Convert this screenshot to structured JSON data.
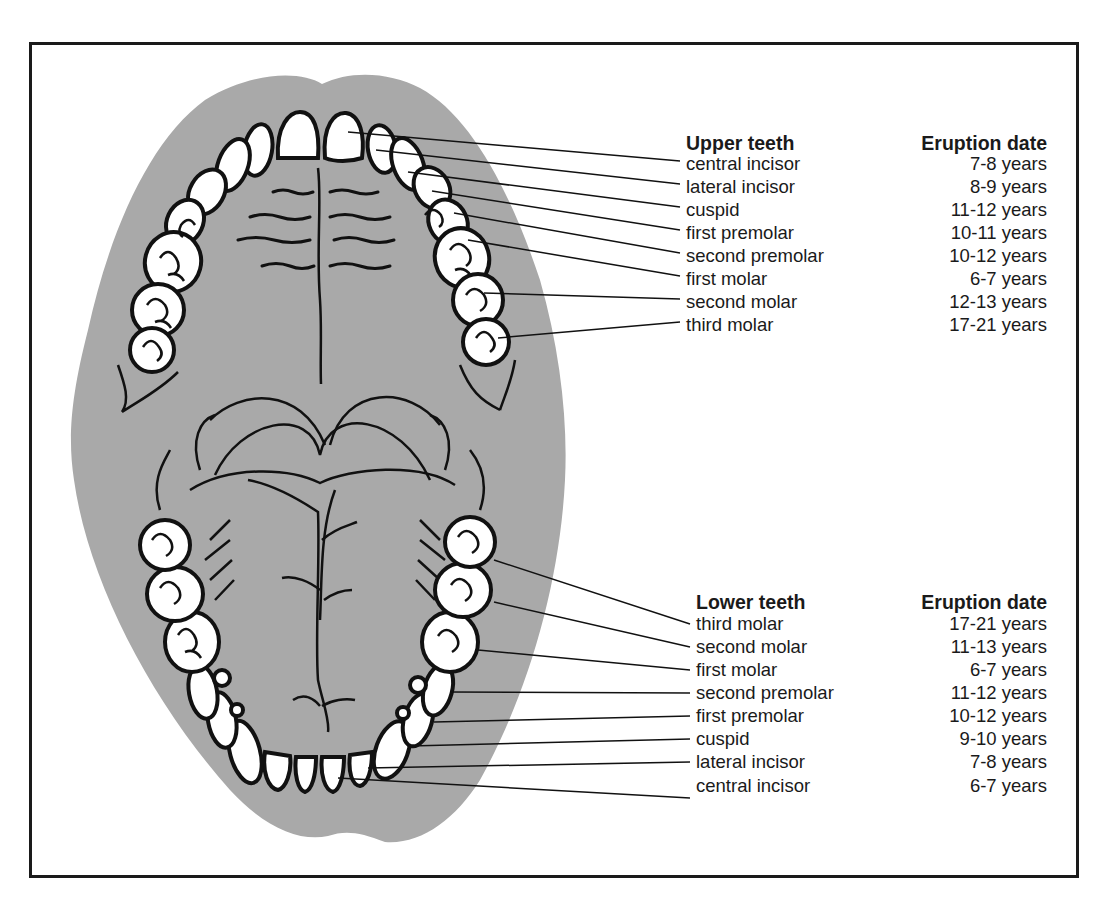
{
  "figure": {
    "colors": {
      "mouth_fill": "#a9a9a9",
      "tooth_fill": "#ffffff",
      "outline": "#111111",
      "frame": "#1a1a1a"
    }
  },
  "upper": {
    "header_name": "Upper teeth",
    "header_date": "Eruption date",
    "rows": [
      {
        "name": "central incisor",
        "date": "7-8 years"
      },
      {
        "name": "lateral incisor",
        "date": "8-9 years"
      },
      {
        "name": "cuspid",
        "date": "11-12 years"
      },
      {
        "name": "first premolar",
        "date": "10-11 years"
      },
      {
        "name": "second premolar",
        "date": "10-12 years"
      },
      {
        "name": "first molar",
        "date": "6-7 years"
      },
      {
        "name": "second molar",
        "date": "12-13 years"
      },
      {
        "name": "third molar",
        "date": "17-21 years"
      }
    ]
  },
  "lower": {
    "header_name": "Lower teeth",
    "header_date": "Eruption date",
    "rows": [
      {
        "name": "third molar",
        "date": "17-21 years"
      },
      {
        "name": "second molar",
        "date": "11-13 years"
      },
      {
        "name": "first molar",
        "date": "6-7 years"
      },
      {
        "name": "second premolar",
        "date": "11-12 years"
      },
      {
        "name": "first premolar",
        "date": "10-12 years"
      },
      {
        "name": "cuspid",
        "date": "9-10 years"
      },
      {
        "name": "lateral incisor",
        "date": "7-8 years"
      },
      {
        "name": "central incisor",
        "date": "6-7 years"
      }
    ]
  }
}
